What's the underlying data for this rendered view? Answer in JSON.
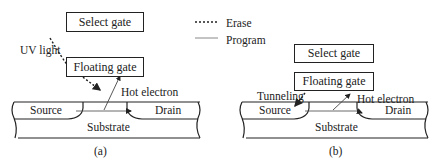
{
  "legend": {
    "erase": "Erase",
    "program": "Program"
  },
  "panel_a": {
    "select_gate": "Select gate",
    "floating_gate": "Floating gate",
    "uv_light": "UV light",
    "hot_electron": "Hot electron",
    "source": "Source",
    "drain": "Drain",
    "substrate": "Substrate",
    "caption": "(a)"
  },
  "panel_b": {
    "select_gate": "Select gate",
    "floating_gate": "Floating gate",
    "tunneling": "Tunneling",
    "hot_electron": "Hot electron",
    "source": "Source",
    "drain": "Drain",
    "substrate": "Substrate",
    "caption": "(b)"
  }
}
